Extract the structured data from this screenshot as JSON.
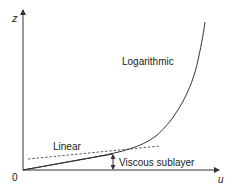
{
  "diagram": {
    "axes": {
      "y_label": "z",
      "x_label": "u",
      "origin_label": "0"
    },
    "curves": [
      {
        "name": "Logarithmic",
        "style": "solid"
      },
      {
        "name": "Linear",
        "style": "solid"
      },
      {
        "name": "Linear extension",
        "style": "dashed"
      }
    ],
    "labels": {
      "logarithmic": "Logarithmic",
      "linear": "Linear",
      "viscous_sublayer": "Viscous sublayer"
    },
    "colors": {
      "line": "#333333",
      "text": "#1a1a1a",
      "background": "#ffffff"
    }
  }
}
